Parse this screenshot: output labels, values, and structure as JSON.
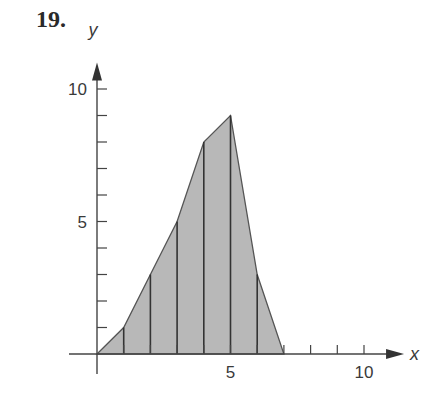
{
  "problem_number": "19.",
  "chart_data": {
    "type": "area",
    "title": "",
    "xlabel": "x",
    "ylabel": "y",
    "x": [
      0,
      1,
      2,
      3,
      4,
      5,
      6,
      7
    ],
    "values": [
      0,
      1,
      3,
      5,
      8,
      9,
      3,
      0
    ],
    "x_ticks": [
      1,
      2,
      3,
      4,
      5,
      6,
      7,
      8,
      9,
      10
    ],
    "x_tick_labels": {
      "5": "5",
      "10": "10"
    },
    "y_ticks": [
      1,
      2,
      3,
      4,
      5,
      6,
      7,
      8,
      9,
      10
    ],
    "y_tick_labels": {
      "5": "5",
      "10": "10"
    },
    "xlim": [
      0,
      11.5
    ],
    "ylim": [
      0,
      11
    ],
    "vertical_lines_at": [
      1,
      2,
      3,
      4,
      5,
      6
    ],
    "fill_color": "#b8b8b8",
    "grid": false,
    "legend": null
  }
}
